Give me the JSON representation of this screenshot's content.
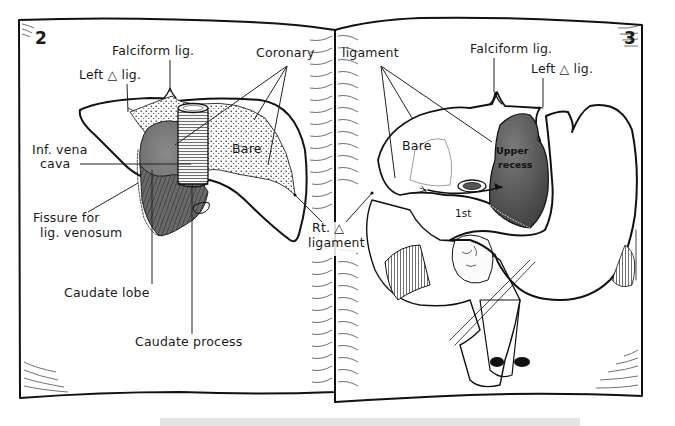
{
  "figure": {
    "type": "anatomical illustration, open book spread",
    "left_page": {
      "page_number": "2",
      "labels": {
        "falciform": "Falciform lig.",
        "left_triangular": "Left △ lig.",
        "coronary_part1": "Coronary",
        "ivc_line1": "Inf. vena",
        "ivc_line2": "cava",
        "bare": "Bare",
        "fissure_line1": "Fissure for",
        "fissure_line2": "lig. venosum",
        "caudate_lobe": "Caudate lobe",
        "caudate_process": "Caudate process"
      }
    },
    "right_page": {
      "page_number": "3",
      "labels": {
        "coronary_part2": "ligament",
        "falciform": "Falciform lig.",
        "left_triangular": "Left △ lig.",
        "bare": "Bare",
        "upper_recess_line1": "Upper",
        "upper_recess_line2": "recess",
        "first_part": "1st",
        "signature": "N.T."
      }
    },
    "gutter_labels": {
      "rt_triangular_line1": "Rt. △",
      "rt_triangular_line2": "ligament"
    },
    "colors": {
      "ink": "#111111",
      "paper": "#ffffff",
      "dark_fill": "#6e6e6e",
      "recess_fill": "#5a5a5a",
      "stipple": "#222222"
    }
  }
}
